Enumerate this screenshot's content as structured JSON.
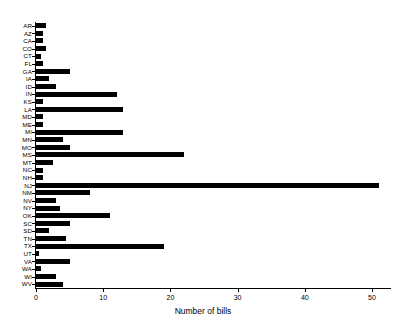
{
  "chart_data": {
    "type": "bar",
    "orientation": "horizontal",
    "title": "",
    "subtitle": "",
    "xlabel": "Number of bills",
    "ylabel": "",
    "xlim": [
      0,
      52
    ],
    "xticks": [
      0,
      10,
      20,
      30,
      40,
      50
    ],
    "xtick_labels": [
      "0",
      "10",
      "20",
      "30",
      "40",
      "50"
    ],
    "grid": false,
    "legend": null,
    "bar_color": "#000000",
    "background_color": "#ffffff",
    "categories": [
      "AR",
      "AZ",
      "CA",
      "CO",
      "CT",
      "FL",
      "GA",
      "IA",
      "ID",
      "IN",
      "KS",
      "LA",
      "MD",
      "ME",
      "MI",
      "MN",
      "MO",
      "MS",
      "MT",
      "NC",
      "NH",
      "NJ",
      "NM",
      "NV",
      "NY",
      "OK",
      "SC",
      "SD",
      "TN",
      "TX",
      "UT",
      "VA",
      "WA",
      "WI",
      "WV"
    ],
    "values": [
      1.5,
      1,
      1,
      1.5,
      0.8,
      1,
      5,
      2,
      3,
      12,
      1,
      13,
      1,
      1,
      13,
      4,
      5,
      22,
      2.5,
      1,
      1,
      51,
      8,
      3,
      3.5,
      11,
      5,
      2,
      4.5,
      19,
      0.5,
      5,
      0.7,
      3,
      4
    ]
  }
}
